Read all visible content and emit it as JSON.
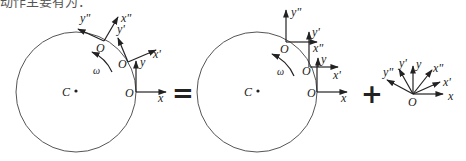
{
  "caption_fragment": "动作主要有为：",
  "labels": {
    "center": "C",
    "omega": "ω",
    "origin": "O",
    "x": "x",
    "y": "y",
    "x1": "x'",
    "y1": "y'",
    "x2": "x\"",
    "y2": "y\""
  },
  "operators": {
    "equals": "=",
    "plus": "+"
  },
  "panels": [
    {
      "name": "rolling-body-rotating-frames",
      "description": "Circle with center C, angular velocity ω, frames (x,y), (x',y'), (x\",y\") attached at successive contact points O, rotating with the body"
    },
    {
      "name": "rolling-body-translating-frames",
      "description": "Circle with center C, angular velocity ω, frames translated without rotation along the rim"
    },
    {
      "name": "rotation-about-O",
      "description": "Pure rotation of axes x,y, x',y', x\",y\" about common origin O"
    }
  ]
}
